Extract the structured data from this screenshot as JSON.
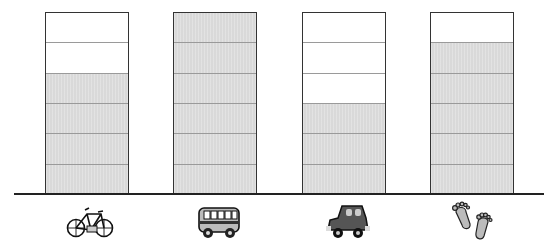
{
  "chart_data": {
    "type": "bar",
    "title": "",
    "xlabel": "",
    "ylabel": "",
    "categories": [
      "bike",
      "bus",
      "car",
      "walk"
    ],
    "values": [
      4,
      6,
      3,
      5
    ],
    "ylim": [
      0,
      6
    ],
    "grid": true,
    "legend": "none",
    "category_icons": [
      "bicycle-icon",
      "bus-icon",
      "car-icon",
      "footprints-icon"
    ],
    "fill_color": "#d9d9d9"
  }
}
